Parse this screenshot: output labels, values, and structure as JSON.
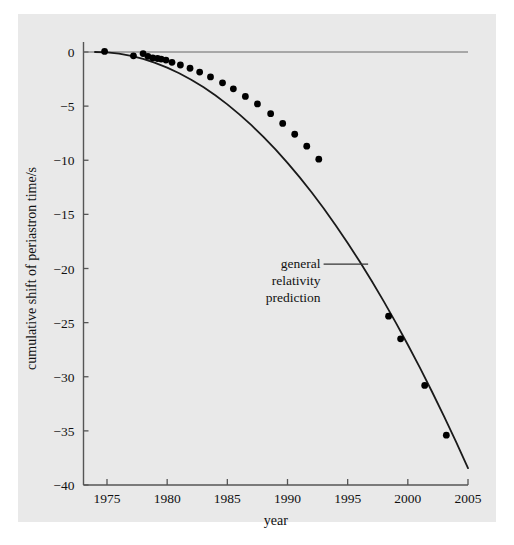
{
  "figure": {
    "background_color": "#e9e9e9",
    "page_color": "#ffffff",
    "axis_color": "#555555",
    "curve_color": "#1a1a1a",
    "marker_color": "#000000"
  },
  "chart_data": {
    "type": "line",
    "title": "",
    "subtitle": "",
    "xlabel": "year",
    "ylabel": "cumulative shift of periastron time/s",
    "xlim": [
      1974.0,
      2005.0
    ],
    "ylim": [
      -40,
      1
    ],
    "xticks": [
      1975,
      1980,
      1985,
      1990,
      1995,
      2000,
      2005
    ],
    "yticks": [
      0,
      -5,
      -10,
      -15,
      -20,
      -25,
      -30,
      -35,
      -40
    ],
    "xtick_labels": [
      "1975",
      "1980",
      "1985",
      "1990",
      "1995",
      "2000",
      "2005"
    ],
    "ytick_labels": [
      "0",
      "−5",
      "−10",
      "−15",
      "−20",
      "−25",
      "−30",
      "−35",
      "−40"
    ],
    "grid": false,
    "legend": null,
    "annotations": [
      {
        "name": "general-relativity-prediction",
        "lines": [
          "general",
          "relativity",
          "prediction"
        ],
        "text": "general relativity prediction",
        "leader_from_x": 1996.7,
        "leader_from_y": -19.6,
        "leader_to_x": 1993.0,
        "leader_to_y": -19.6
      }
    ],
    "series": [
      {
        "name": "general relativity prediction",
        "type": "line",
        "x": [
          1974.0,
          1975.0,
          1976.0,
          1977.0,
          1978.0,
          1979.0,
          1980.0,
          1981.0,
          1982.0,
          1983.0,
          1984.0,
          1985.0,
          1986.0,
          1987.0,
          1988.0,
          1989.0,
          1990.0,
          1991.0,
          1992.0,
          1993.0,
          1994.0,
          1995.0,
          1996.0,
          1997.0,
          1998.0,
          1999.0,
          2000.0,
          2001.0,
          2002.0,
          2003.0,
          2004.0,
          2005.0
        ],
        "y": [
          0.0,
          -0.04,
          -0.16,
          -0.36,
          -0.64,
          -1.0,
          -1.44,
          -1.96,
          -2.56,
          -3.24,
          -4.0,
          -4.84,
          -5.76,
          -6.76,
          -7.84,
          -9.0,
          -10.24,
          -11.56,
          -12.96,
          -14.44,
          -16.0,
          -17.64,
          -19.36,
          -21.16,
          -23.04,
          -25.0,
          -27.04,
          -29.16,
          -31.36,
          -33.64,
          -36.0,
          -38.44
        ]
      },
      {
        "name": "measured data points",
        "type": "scatter",
        "x": [
          1974.8,
          1977.2,
          1978.0,
          1978.4,
          1978.8,
          1979.2,
          1979.5,
          1979.9,
          1980.4,
          1981.1,
          1981.9,
          1982.7,
          1983.6,
          1984.6,
          1985.5,
          1986.5,
          1987.5,
          1988.6,
          1989.6,
          1990.6,
          1991.6,
          1992.6,
          1998.4,
          1999.4,
          2001.4,
          2003.2
        ],
        "y": [
          0.05,
          -0.35,
          -0.15,
          -0.4,
          -0.55,
          -0.6,
          -0.65,
          -0.75,
          -0.95,
          -1.2,
          -1.5,
          -1.85,
          -2.3,
          -2.85,
          -3.4,
          -4.1,
          -4.8,
          -5.7,
          -6.6,
          -7.6,
          -8.7,
          -9.9,
          -24.4,
          -26.5,
          -30.8,
          -35.4
        ]
      }
    ]
  },
  "axes": {
    "x_axis_name": "year-axis",
    "y_axis_name": "cumulative-shift-axis"
  }
}
